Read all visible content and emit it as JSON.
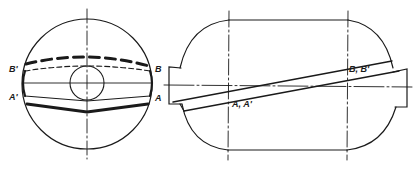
{
  "figure": {
    "type": "technical-drawing",
    "background": "#ffffff",
    "ink": "#1a1a1a",
    "views": [
      {
        "name": "end-view",
        "labels": {
          "b_prime": "B'",
          "b": "B",
          "a_prime": "A'",
          "a": "A"
        }
      },
      {
        "name": "side-view",
        "labels": {
          "a_a_prime": "A, A'",
          "b_b_prime": "B, B'"
        }
      }
    ]
  }
}
